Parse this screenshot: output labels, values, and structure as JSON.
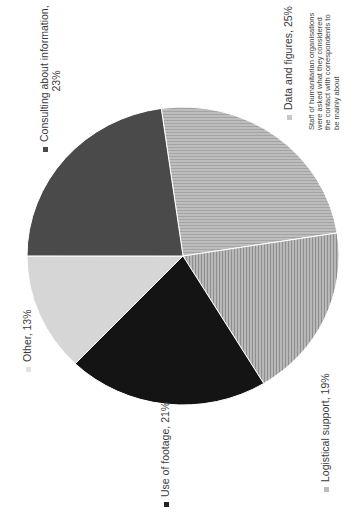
{
  "chart_data": {
    "type": "pie",
    "orientation": "rotated -90deg (text reads bottom-to-top)",
    "title": "",
    "categories": [
      "Data and figures",
      "Logistical support",
      "Use of footage",
      "Other",
      "Consulting about information"
    ],
    "values": [
      25,
      19,
      21,
      13,
      23
    ],
    "unit": "%",
    "labels": [
      {
        "text": "Data and figures, 25%",
        "color": "#b3b3b3",
        "pattern": "horizontal-stripes"
      },
      {
        "text": "Logistical support, 19%",
        "color": "#a6a6a6",
        "pattern": "vertical-stripes"
      },
      {
        "text": "Use of footage, 21%",
        "color": "#141414",
        "pattern": "solid"
      },
      {
        "text": "Other, 13%",
        "color": "#d6d6d6",
        "pattern": "solid"
      },
      {
        "text": "Consulting about information, 23%",
        "color": "#4a4a4a",
        "pattern": "solid"
      }
    ],
    "start_angle_deg": -98,
    "note": "Staff of humanitarian organisations were asked what they considered the contact with correspondents to be mainly about"
  },
  "legend": {
    "consulting_line1": "Consulting about information,",
    "consulting_line2": "23%",
    "data": "Data and figures, 25%",
    "logistical": "Logistical support, 19%",
    "footage": "Use of footage, 21%",
    "other": "Other, 13%"
  },
  "note": {
    "text": "Staff of humanitarian organisations were asked what they considered the contact with correspondents to be mainly about"
  }
}
